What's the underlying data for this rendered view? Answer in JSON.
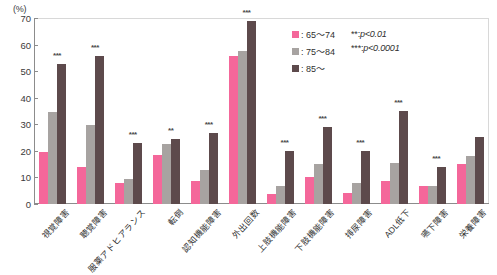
{
  "chart_data": {
    "type": "bar",
    "title": "",
    "xlabel": "",
    "ylabel": "(%)",
    "ylim": [
      0,
      70
    ],
    "yticks": [
      0,
      10,
      20,
      30,
      40,
      50,
      60,
      70
    ],
    "grid": false,
    "legend_position": "top-right",
    "categories": [
      "視覚障害",
      "聴覚障害",
      "服薬アドヒアランス",
      "転倒",
      "認知機能障害",
      "外出回数",
      "上肢機能障害",
      "下肢機能障害",
      "排尿障害",
      "ADL低下",
      "嚥下障害",
      "栄養障害"
    ],
    "series": [
      {
        "name": "65〜74",
        "color": "#f4679a",
        "values": [
          19.5,
          14.0,
          7.8,
          18.6,
          8.7,
          55.8,
          3.9,
          10.1,
          4.1,
          8.8,
          6.8,
          14.9
        ]
      },
      {
        "name": "75〜84",
        "color": "#a7a3a1",
        "values": [
          34.8,
          29.7,
          9.6,
          22.5,
          12.9,
          57.6,
          6.6,
          14.9,
          8.0,
          15.6,
          6.8,
          18.1
        ]
      },
      {
        "name": "85〜",
        "color": "#5d4a4c",
        "values": [
          52.8,
          55.7,
          22.9,
          24.6,
          26.7,
          68.9,
          20.1,
          29.0,
          19.9,
          34.9,
          14.1,
          25.1
        ]
      }
    ],
    "significance": [
      "***",
      "***",
      "***",
      "**",
      "***",
      "***",
      "***",
      "***",
      "***",
      "***",
      "***",
      ""
    ]
  },
  "legend": {
    "series_rows": [
      {
        "label": ": 65〜74"
      },
      {
        "label": ": 75〜84"
      },
      {
        "label": ": 85〜"
      }
    ],
    "notes": [
      {
        "marker": "**:",
        "text": "p<0.01"
      },
      {
        "marker": "***:",
        "text": "p<0.0001"
      }
    ]
  },
  "axis": {
    "unit": "(%)"
  }
}
